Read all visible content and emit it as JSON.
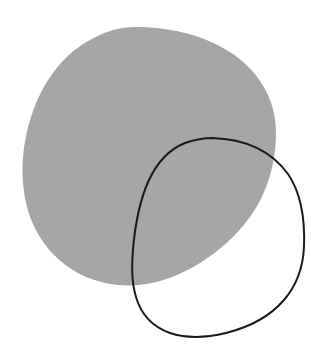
{
  "figure": {
    "title": "Overlapping shapes figure",
    "width": 311,
    "height": 359,
    "background_color": "#ffffff"
  },
  "shapes": [
    {
      "name": "gray-blob",
      "label": "Filled gray blob",
      "type": "filled-closed-curve",
      "fill_color": "#a8a8a8",
      "stroke_color": "none",
      "stroke_width": 0,
      "texture": "subtle-noise",
      "bounds": {
        "left": 22,
        "top": 27,
        "right": 276,
        "bottom": 286
      },
      "extreme_points": {
        "topmost": [
          135,
          27
        ],
        "leftmost": [
          22,
          160
        ],
        "rightmost": [
          276,
          165
        ],
        "bottommost": [
          140,
          286
        ]
      },
      "path": "M 135 27 C 173 27 206 36 233 54 C 259 72 276 100 276 132 C 276 162 268 192 250 217 C 231 243 203 265 172 277 C 141 289 109 288 82 275 C 55 262 35 237 27 207 C 19 176 22 142 33 111 C 45 78 66 52 92 39 C 106 31 120 27 135 27 Z"
    },
    {
      "name": "black-outline-curve",
      "label": "Black outline loop",
      "type": "stroked-closed-curve",
      "fill_color": "none",
      "stroke_color": "#1a1a1a",
      "stroke_width": 2,
      "bounds": {
        "left": 132,
        "top": 138,
        "right": 304,
        "bottom": 337
      },
      "extreme_points": {
        "topmost": [
          212,
          138
        ],
        "leftmost": [
          132,
          250
        ],
        "rightmost": [
          304,
          258
        ],
        "bottommost": [
          190,
          337
        ]
      },
      "path": "M 212 138 C 246 139 272 152 288 174 C 301 193 305 221 304 247 C 303 268 296 286 284 300 C 271 315 250 327 226 333 C 205 338 185 338 170 333 C 153 327 141 314 136 297 C 131 280 132 264 133 249 C 135 226 139 203 148 182 C 157 162 170 149 185 143 C 194 140 203 138 212 138 Z"
    }
  ],
  "annotations": {
    "shape_count": "2",
    "overlap_region": "lower-right of gray blob"
  }
}
